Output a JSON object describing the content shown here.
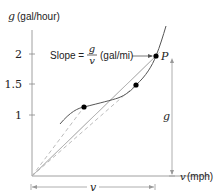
{
  "diagram": {
    "y_axis_label_var": "g",
    "y_axis_label_unit": "(gal/hour)",
    "x_axis_label_var": "v",
    "x_axis_label_unit": "(mph)",
    "y_ticks": [
      "2",
      "1.5",
      "1"
    ],
    "slope_label_prefix": "Slope =",
    "slope_numerator": "g",
    "slope_denominator": "v",
    "slope_unit": "(gal/mi)",
    "point_label": "P",
    "vertical_dimension_label": "g",
    "horizontal_dimension_label": "v",
    "colors": {
      "axis": "#888888",
      "curve": "#555555",
      "line": "#999999",
      "dashed": "#aaaaaa",
      "point": "#000000",
      "text": "#222222"
    }
  }
}
